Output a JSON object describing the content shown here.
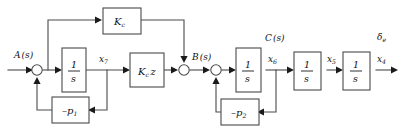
{
  "diagram": {
    "type": "block-diagram",
    "stroke_color": "#4a4a4a",
    "text_color": "#111111",
    "background_color": "#ffffff",
    "blocks": [
      {
        "id": "kc",
        "label": "K",
        "sub": "c",
        "name": "block-kc"
      },
      {
        "id": "int1",
        "num": "1",
        "den": "s",
        "name": "block-integrator-1"
      },
      {
        "id": "kcz",
        "label": "K",
        "sub": "c",
        "tail": "z",
        "name": "block-kc-z"
      },
      {
        "id": "p1",
        "label": "–p",
        "sub": "1",
        "name": "block-neg-p1"
      },
      {
        "id": "int2",
        "num": "1",
        "den": "s",
        "name": "block-integrator-2"
      },
      {
        "id": "p2",
        "label": "–p",
        "sub": "2",
        "name": "block-neg-p2"
      },
      {
        "id": "int3",
        "num": "1",
        "den": "s",
        "name": "block-integrator-3"
      },
      {
        "id": "int4",
        "num": "1",
        "den": "s",
        "name": "block-integrator-4"
      }
    ],
    "signals": [
      {
        "id": "A",
        "base": "A",
        "paren": "(s)",
        "name": "signal-label-a-of-s"
      },
      {
        "id": "x7",
        "base": "x",
        "sub": "7",
        "name": "signal-label-x7"
      },
      {
        "id": "B",
        "base": "B",
        "paren": "(s)",
        "name": "signal-label-b-of-s"
      },
      {
        "id": "C",
        "base": "C",
        "paren": "(s)",
        "name": "signal-label-c-of-s"
      },
      {
        "id": "x6",
        "base": "x",
        "sub": "6",
        "name": "signal-label-x6"
      },
      {
        "id": "x5",
        "base": "x",
        "sub": "5",
        "name": "signal-label-x5"
      },
      {
        "id": "de",
        "base": "δ",
        "sub": "e",
        "name": "signal-label-delta-e"
      },
      {
        "id": "x4",
        "base": "x",
        "sub": "4",
        "name": "signal-label-x4"
      }
    ],
    "junctions": [
      {
        "id": "sum1",
        "name": "summing-junction-1"
      },
      {
        "id": "sum2",
        "name": "summing-junction-2"
      },
      {
        "id": "sum3",
        "name": "summing-junction-3"
      }
    ]
  }
}
